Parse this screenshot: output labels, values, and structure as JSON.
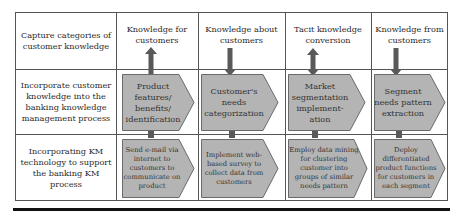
{
  "diagram": {
    "row_labels": [
      "Capture categories of customer knowledge",
      "Incorporate customer knowledge into the banking knowledge management process",
      "Incorporating KM technology to support the banking KM process"
    ],
    "columns": [
      {
        "header": "Knowledge for customers",
        "arrow_direction": "up",
        "process": "Product features/ benefits/ identification",
        "technology": "Send e-mail via internet to customers to communicate on product"
      },
      {
        "header": "Knowledge about customers",
        "arrow_direction": "down",
        "process": "Customer's needs categorization",
        "technology": "Implement web-based survey to collect data from customers"
      },
      {
        "header": "Tacit knowledge conversion",
        "arrow_direction": "both",
        "process": "Market segmentation implement-ation",
        "technology": "Employ data mining for clustering customer into groups of similar needs pattern"
      },
      {
        "header": "Knowledge from customers",
        "arrow_direction": "down",
        "process": "Segment needs pattern extraction",
        "technology": "Deploy differentiated product functions for customers in each segment"
      }
    ],
    "colors": {
      "chevron_fill": "#b4b4b4",
      "chevron_stroke": "#6a6a6a",
      "arrow_fill": "#595959",
      "grid_line": "#555555",
      "bottom_rule": "#111111"
    }
  }
}
